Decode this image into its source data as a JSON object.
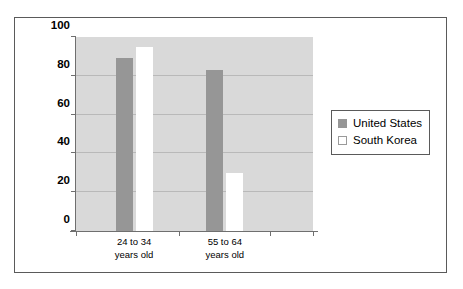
{
  "chart_data": {
    "type": "bar",
    "title": "",
    "xlabel": "",
    "ylabel": "Percentage of Population",
    "ylim": [
      0,
      100
    ],
    "yticks": [
      0,
      20,
      40,
      60,
      80,
      100
    ],
    "ytick_labels": [
      "0",
      "20",
      "40",
      "60",
      "80",
      "100"
    ],
    "grid": true,
    "legend_position": "right-outside",
    "categories": [
      "24 to 34 years old",
      "55 to 64 years old"
    ],
    "category_lines": [
      [
        "24 to 34",
        "years old"
      ],
      [
        "55 to 64",
        "years old"
      ]
    ],
    "series": [
      {
        "name": "United States",
        "color": "#969696",
        "values": [
          89,
          83
        ]
      },
      {
        "name": "South Korea",
        "color": "#ffffff",
        "values": [
          95,
          30
        ]
      }
    ]
  },
  "colors": {
    "plot_background": "#d9d9d9",
    "figure_background": "#ffffff",
    "frame": "#5a5a5a",
    "axis": "#6f6f6f",
    "gridline": "#b9b9b9",
    "united_states": "#969696",
    "south_korea": "#ffffff"
  },
  "legend": {
    "items": [
      {
        "label": "United States"
      },
      {
        "label": "South Korea"
      }
    ]
  }
}
